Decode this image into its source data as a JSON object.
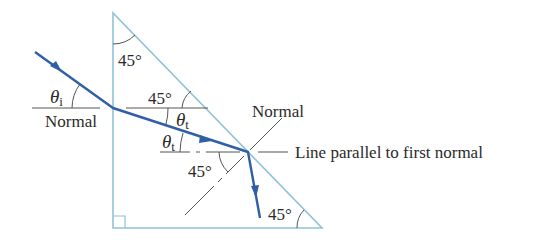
{
  "diagram": {
    "type": "optics-ray-diagram",
    "colors": {
      "prism": "#8fc3d6",
      "ray": "#2f5fa6",
      "guide_lines": "#555555",
      "text": "#2a2a2a",
      "background": "#ffffff"
    },
    "labels": {
      "top_angle": "45°",
      "upper_right_angle": "45°",
      "lower_left_angle": "45°",
      "bottom_right_angle": "45°",
      "theta_i": "θ",
      "theta_i_sub": "i",
      "theta_t_upper": "θ",
      "theta_t_upper_sub": "t",
      "theta_t_lower": "θ",
      "theta_t_lower_sub": "t",
      "normal_left": "Normal",
      "normal_right": "Normal",
      "parallel_line": "Line parallel to first normal"
    }
  }
}
